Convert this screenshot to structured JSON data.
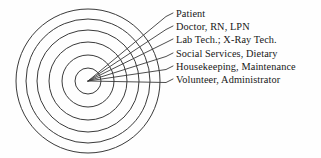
{
  "figure": {
    "name": "concentric-circles-care-levels",
    "background_color": "#fefefe",
    "stroke_color": "#3a3a3a",
    "text_color": "#171717"
  },
  "diagram": {
    "type": "concentric-rings",
    "center": {
      "x": 88,
      "y": 81
    },
    "ring_count": 6,
    "radii": [
      13,
      26,
      39,
      51,
      62,
      72
    ],
    "labels": [
      {
        "text": "Patient",
        "ring_index": 0,
        "leader_tip_x": 173,
        "leader_tip_y": 13
      },
      {
        "text": "Doctor, RN, LPN",
        "ring_index": 1,
        "leader_tip_x": 173,
        "leader_tip_y": 26
      },
      {
        "text": "Lab Tech.; X-Ray Tech.",
        "ring_index": 2,
        "leader_tip_x": 173,
        "leader_tip_y": 39
      },
      {
        "text": "Social Services, Dietary",
        "ring_index": 3,
        "leader_tip_x": 173,
        "leader_tip_y": 53
      },
      {
        "text": "Housekeeping, Maintenance",
        "ring_index": 4,
        "leader_tip_x": 173,
        "leader_tip_y": 66
      },
      {
        "text": "Volunteer, Administrator",
        "ring_index": 5,
        "leader_tip_x": 173,
        "leader_tip_y": 79
      }
    ]
  }
}
